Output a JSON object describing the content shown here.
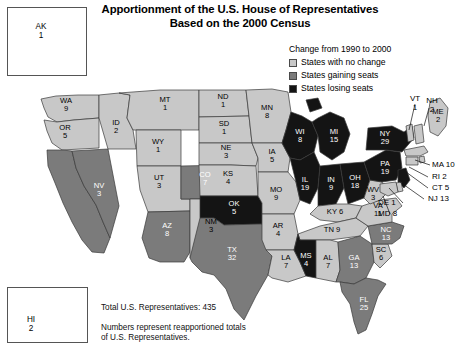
{
  "title": {
    "line1": "Apportionment of the U.S. House of Representatives",
    "line2": "Based on the 2000 Census"
  },
  "legend": {
    "title": "Change from 1990 to 2000",
    "items": [
      {
        "label": "States with no change",
        "color": "#c8c8c8",
        "key": "no-change"
      },
      {
        "label": "States gaining seats",
        "color": "#7b7b7b",
        "key": "gaining"
      },
      {
        "label": "States losing seats",
        "color": "#141414",
        "key": "losing"
      }
    ]
  },
  "captions": {
    "total": "Total U.S. Representatives: 435",
    "note": "Numbers represent reapportioned totals of U.S. Representatives."
  },
  "insets": [
    {
      "abbr": "AK",
      "seats": "1",
      "category": "no-change"
    },
    {
      "abbr": "HI",
      "seats": "2",
      "category": "no-change"
    }
  ],
  "chart_data": {
    "type": "map",
    "title": "Apportionment of the U.S. House of Representatives Based on the 2000 Census",
    "value_label": "Reapportioned U.S. Representatives",
    "category_label": "Change from 1990 to 2000",
    "total": 435,
    "categories": [
      "no-change",
      "gaining",
      "losing"
    ],
    "states": [
      {
        "abbr": "WA",
        "seats": 9,
        "category": "no-change"
      },
      {
        "abbr": "OR",
        "seats": 5,
        "category": "no-change"
      },
      {
        "abbr": "CA",
        "seats": 53,
        "category": "gaining"
      },
      {
        "abbr": "NV",
        "seats": 3,
        "category": "gaining"
      },
      {
        "abbr": "ID",
        "seats": 2,
        "category": "no-change"
      },
      {
        "abbr": "MT",
        "seats": 1,
        "category": "no-change"
      },
      {
        "abbr": "WY",
        "seats": 1,
        "category": "no-change"
      },
      {
        "abbr": "UT",
        "seats": 3,
        "category": "no-change"
      },
      {
        "abbr": "AZ",
        "seats": 8,
        "category": "gaining"
      },
      {
        "abbr": "CO",
        "seats": 7,
        "category": "gaining"
      },
      {
        "abbr": "NM",
        "seats": 3,
        "category": "no-change"
      },
      {
        "abbr": "ND",
        "seats": 1,
        "category": "no-change"
      },
      {
        "abbr": "SD",
        "seats": 1,
        "category": "no-change"
      },
      {
        "abbr": "NE",
        "seats": 3,
        "category": "no-change"
      },
      {
        "abbr": "KS",
        "seats": 4,
        "category": "no-change"
      },
      {
        "abbr": "OK",
        "seats": 5,
        "category": "losing"
      },
      {
        "abbr": "TX",
        "seats": 32,
        "category": "gaining"
      },
      {
        "abbr": "MN",
        "seats": 8,
        "category": "no-change"
      },
      {
        "abbr": "IA",
        "seats": 5,
        "category": "no-change"
      },
      {
        "abbr": "MO",
        "seats": 9,
        "category": "no-change"
      },
      {
        "abbr": "AR",
        "seats": 4,
        "category": "no-change"
      },
      {
        "abbr": "LA",
        "seats": 7,
        "category": "no-change"
      },
      {
        "abbr": "WI",
        "seats": 8,
        "category": "losing"
      },
      {
        "abbr": "IL",
        "seats": 19,
        "category": "losing"
      },
      {
        "abbr": "MI",
        "seats": 15,
        "category": "losing"
      },
      {
        "abbr": "IN",
        "seats": 9,
        "category": "losing"
      },
      {
        "abbr": "OH",
        "seats": 18,
        "category": "losing"
      },
      {
        "abbr": "KY",
        "seats": 6,
        "category": "no-change"
      },
      {
        "abbr": "TN",
        "seats": 9,
        "category": "no-change"
      },
      {
        "abbr": "MS",
        "seats": 4,
        "category": "losing"
      },
      {
        "abbr": "AL",
        "seats": 7,
        "category": "no-change"
      },
      {
        "abbr": "GA",
        "seats": 13,
        "category": "gaining"
      },
      {
        "abbr": "FL",
        "seats": 25,
        "category": "gaining"
      },
      {
        "abbr": "SC",
        "seats": 6,
        "category": "no-change"
      },
      {
        "abbr": "NC",
        "seats": 13,
        "category": "gaining"
      },
      {
        "abbr": "VA",
        "seats": 11,
        "category": "no-change"
      },
      {
        "abbr": "WV",
        "seats": 3,
        "category": "no-change"
      },
      {
        "abbr": "PA",
        "seats": 19,
        "category": "losing"
      },
      {
        "abbr": "NY",
        "seats": 29,
        "category": "losing"
      },
      {
        "abbr": "VT",
        "seats": 1,
        "category": "no-change"
      },
      {
        "abbr": "NH",
        "seats": 2,
        "category": "no-change"
      },
      {
        "abbr": "ME",
        "seats": 2,
        "category": "no-change"
      },
      {
        "abbr": "MA",
        "seats": 10,
        "category": "no-change"
      },
      {
        "abbr": "RI",
        "seats": 2,
        "category": "no-change"
      },
      {
        "abbr": "CT",
        "seats": 5,
        "category": "no-change"
      },
      {
        "abbr": "NJ",
        "seats": 13,
        "category": "losing"
      },
      {
        "abbr": "DE",
        "seats": 1,
        "category": "no-change"
      },
      {
        "abbr": "MD",
        "seats": 8,
        "category": "no-change"
      },
      {
        "abbr": "AK",
        "seats": 1,
        "category": "no-change"
      },
      {
        "abbr": "HI",
        "seats": 2,
        "category": "no-change"
      }
    ]
  },
  "map_labels": {
    "inline": [
      {
        "id": "WA",
        "text": "WA\n9"
      },
      {
        "id": "OR",
        "text": "OR\n5"
      },
      {
        "id": "CA",
        "text": "CA\n53"
      },
      {
        "id": "NV",
        "text": "NV\n3"
      },
      {
        "id": "ID",
        "text": "ID\n2"
      },
      {
        "id": "MT",
        "text": "MT\n1"
      },
      {
        "id": "WY",
        "text": "WY\n1"
      },
      {
        "id": "UT",
        "text": "UT\n3"
      },
      {
        "id": "AZ",
        "text": "AZ\n8"
      },
      {
        "id": "CO",
        "text": "CO\n7"
      },
      {
        "id": "NM",
        "text": "NM\n3"
      },
      {
        "id": "ND",
        "text": "ND\n1"
      },
      {
        "id": "SD",
        "text": "SD\n1"
      },
      {
        "id": "NE",
        "text": "NE\n3"
      },
      {
        "id": "KS",
        "text": "KS\n4"
      },
      {
        "id": "OK",
        "text": "OK\n5"
      },
      {
        "id": "TX",
        "text": "TX\n32"
      },
      {
        "id": "MN",
        "text": "MN\n8"
      },
      {
        "id": "IA",
        "text": "IA\n5"
      },
      {
        "id": "MO",
        "text": "MO\n9"
      },
      {
        "id": "AR",
        "text": "AR\n4"
      },
      {
        "id": "LA",
        "text": "LA\n7"
      },
      {
        "id": "WI",
        "text": "WI\n8"
      },
      {
        "id": "IL",
        "text": "IL\n19"
      },
      {
        "id": "MI",
        "text": "MI\n15"
      },
      {
        "id": "IN",
        "text": "IN\n9"
      },
      {
        "id": "OH",
        "text": "OH\n18"
      },
      {
        "id": "KY",
        "text": "KY 6"
      },
      {
        "id": "TN",
        "text": "TN 9"
      },
      {
        "id": "MS",
        "text": "MS\n4"
      },
      {
        "id": "AL",
        "text": "AL\n7"
      },
      {
        "id": "GA",
        "text": "GA\n13"
      },
      {
        "id": "FL",
        "text": "FL\n25"
      },
      {
        "id": "SC",
        "text": "SC\n6"
      },
      {
        "id": "NC",
        "text": "NC\n13"
      },
      {
        "id": "VA",
        "text": "VA\n11"
      },
      {
        "id": "WV",
        "text": "WV\n3"
      },
      {
        "id": "PA",
        "text": "PA\n19"
      },
      {
        "id": "NY",
        "text": "NY\n29"
      },
      {
        "id": "ME",
        "text": "ME\n2"
      }
    ],
    "callouts": [
      {
        "id": "VT",
        "text": "VT\n1"
      },
      {
        "id": "NH",
        "text": "NH\n2"
      },
      {
        "id": "MA",
        "text": "MA 10"
      },
      {
        "id": "RI",
        "text": "RI 2"
      },
      {
        "id": "CT",
        "text": "CT 5"
      },
      {
        "id": "NJ",
        "text": "NJ 13"
      },
      {
        "id": "DE",
        "text": "DE 1"
      },
      {
        "id": "MD",
        "text": "MD 8"
      }
    ]
  }
}
